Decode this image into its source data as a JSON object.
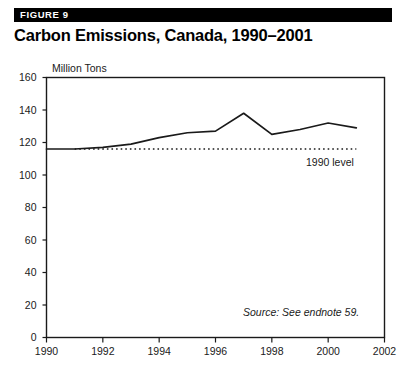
{
  "header": {
    "figure_label": "FIGURE 9",
    "title": "Carbon Emissions, Canada, 1990–2001",
    "bar_color": "#000000",
    "label_color": "#ffffff"
  },
  "annotations": {
    "reference_line_label": "1990 level",
    "source_note": "Source: See endnote 59."
  },
  "chart_data": {
    "type": "line",
    "title": "Carbon Emissions, Canada, 1990–2001",
    "subtitle": "",
    "xlabel": "",
    "ylabel": "Million Tons",
    "xlim": [
      1990,
      2002
    ],
    "ylim": [
      0,
      160
    ],
    "grid": false,
    "legend": "none",
    "line_color": "#1a1a1a",
    "x": [
      1990,
      1991,
      1992,
      1993,
      1994,
      1995,
      1996,
      1997,
      1998,
      1999,
      2000,
      2001
    ],
    "xticks": [
      1990,
      1992,
      1994,
      1996,
      1998,
      2000,
      2002
    ],
    "xtick_labels": [
      "1990",
      "1992",
      "1994",
      "1996",
      "1998",
      "2000",
      "2002"
    ],
    "yticks": [
      0,
      20,
      40,
      60,
      80,
      100,
      120,
      140,
      160
    ],
    "ytick_labels": [
      "0",
      "20",
      "40",
      "60",
      "80",
      "100",
      "120",
      "140",
      "160"
    ],
    "series": [
      {
        "name": "Carbon emissions",
        "values": [
          116,
          116,
          117,
          119,
          123,
          126,
          127,
          138,
          125,
          128,
          132,
          129
        ]
      }
    ],
    "reference_line": {
      "label": "1990 level",
      "value": 116,
      "style": "dotted",
      "x_start": 1991,
      "x_end": 2001
    }
  }
}
